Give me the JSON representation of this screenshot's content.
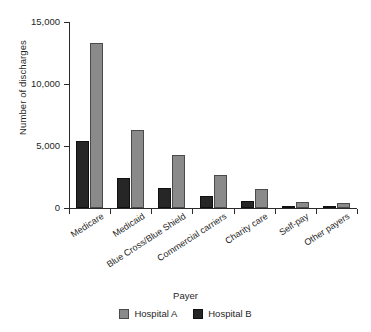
{
  "chart_data": {
    "type": "bar",
    "title": "",
    "xlabel": "Payer",
    "ylabel": "Number of discharges",
    "categories": [
      "Medicare",
      "Medicaid",
      "Blue Cross/Blue Shield",
      "Commercial carriers",
      "Charity care",
      "Self-pay",
      "Other payers"
    ],
    "series": [
      {
        "name": "Hospital A",
        "color": "#8a8a8a",
        "values": [
          13300,
          6300,
          4300,
          2700,
          1500,
          450,
          400
        ]
      },
      {
        "name": "Hospital B",
        "color": "#262626",
        "values": [
          5400,
          2400,
          1650,
          1000,
          600,
          150,
          120
        ]
      }
    ],
    "ylim": [
      0,
      15000
    ],
    "yticks": [
      0,
      5000,
      10000,
      15000
    ],
    "ytick_labels": [
      "0",
      "5,000",
      "10,000",
      "15,000"
    ],
    "grid": false,
    "legend_position": "bottom"
  },
  "axes": {
    "y_title": "Number of discharges",
    "x_title": "Payer",
    "y_tick_labels": [
      "15,000",
      "10,000",
      "5,000",
      "0"
    ]
  },
  "legend": {
    "items": [
      {
        "label": "Hospital A",
        "color": "#8a8a8a"
      },
      {
        "label": "Hospital B",
        "color": "#262626"
      }
    ]
  }
}
